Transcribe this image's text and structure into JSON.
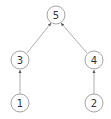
{
  "diagram": {
    "type": "tree",
    "nodes": [
      {
        "id": "5",
        "label": "5",
        "x": 56,
        "y": 15
      },
      {
        "id": "3",
        "label": "3",
        "x": 20,
        "y": 60
      },
      {
        "id": "4",
        "label": "4",
        "x": 94,
        "y": 60
      },
      {
        "id": "1",
        "label": "1",
        "x": 20,
        "y": 103
      },
      {
        "id": "2",
        "label": "2",
        "x": 94,
        "y": 103
      }
    ],
    "edges": [
      {
        "from": "1",
        "to": "3",
        "directed": true
      },
      {
        "from": "2",
        "to": "4",
        "directed": true
      },
      {
        "from": "3",
        "to": "5",
        "directed": true
      },
      {
        "from": "4",
        "to": "5",
        "directed": true
      }
    ],
    "colors": {
      "stroke": "#9a9a9a",
      "text": "#333333",
      "background": "#ffffff"
    }
  }
}
